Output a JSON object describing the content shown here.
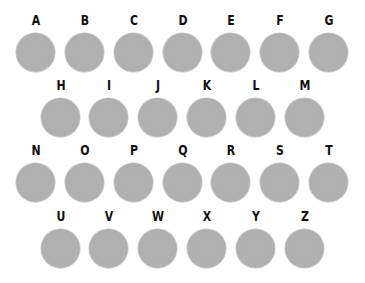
{
  "colors": {
    "background": "#ffffff",
    "button_fill": "#b0b0b0",
    "letter": "#111111"
  },
  "rows": [
    {
      "keys": [
        "A",
        "B",
        "C",
        "D",
        "E",
        "F",
        "G"
      ]
    },
    {
      "keys": [
        "H",
        "I",
        "J",
        "K",
        "L",
        "M"
      ]
    },
    {
      "keys": [
        "N",
        "O",
        "P",
        "Q",
        "R",
        "S",
        "T"
      ]
    },
    {
      "keys": [
        "U",
        "V",
        "W",
        "X",
        "Y",
        "Z"
      ]
    }
  ]
}
